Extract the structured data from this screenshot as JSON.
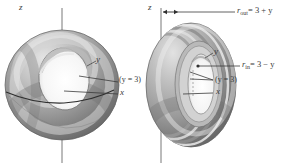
{
  "figure": {
    "type": "geometry-diagram",
    "background_color": "#ffffff",
    "ink_color": "#3a3a3a",
    "surface_colors": {
      "light": "#d9d9d9",
      "mid": "#a8a8a8",
      "dark": "#6e6e6e",
      "shadow": "#565656",
      "highlight": "#efefef"
    },
    "panels": [
      {
        "name": "left-torus",
        "view": "three-quarter view of torus seen from above",
        "labels": [
          {
            "name": "z-axis-label",
            "text": "z"
          },
          {
            "name": "y-axis-label",
            "text": "y"
          },
          {
            "name": "y-equals-3-label",
            "text": "(y = 3)"
          },
          {
            "name": "x-axis-label",
            "text": "x"
          }
        ]
      },
      {
        "name": "right-torus",
        "view": "near edge-on view of torus showing inner and outer radii",
        "labels": [
          {
            "name": "z-axis-label",
            "text": "z"
          },
          {
            "name": "r-out-label",
            "text": "r_out = 3 + y"
          },
          {
            "name": "r-out-label-display",
            "text": "= 3 + y"
          },
          {
            "name": "r-out-sub",
            "text": "out"
          },
          {
            "name": "r-in-label",
            "text": "= 3 − y"
          },
          {
            "name": "r-in-sub",
            "text": "in"
          },
          {
            "name": "r-symbol",
            "text": "r"
          },
          {
            "name": "y-axis-label",
            "text": "y"
          },
          {
            "name": "y-equals-3-label",
            "text": "(y = 3)"
          },
          {
            "name": "x-axis-label",
            "text": "x"
          }
        ]
      }
    ]
  },
  "left": {
    "z_label": "z",
    "y_label": "y",
    "y3_label": "(y = 3)",
    "x_label": "x"
  },
  "right": {
    "z_label": "z",
    "r_symbol": "r",
    "r_out_sub": "out",
    "r_out_rhs": "= 3 + y",
    "r_in_sub": "in",
    "r_in_rhs": "= 3 − y",
    "y_label": "y",
    "y3_label": "(y = 3)",
    "x_label": "x"
  }
}
